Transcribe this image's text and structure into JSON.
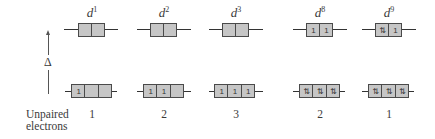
{
  "axis": {
    "symbol": "Δ",
    "direction": "up"
  },
  "configs": [
    {
      "label_base": "d",
      "label_sup": "1",
      "upper": [
        "",
        ""
      ],
      "lower": [
        "1",
        "",
        ""
      ],
      "unpaired": "1"
    },
    {
      "label_base": "d",
      "label_sup": "2",
      "upper": [
        "",
        ""
      ],
      "lower": [
        "1",
        "1",
        ""
      ],
      "unpaired": "2"
    },
    {
      "label_base": "d",
      "label_sup": "3",
      "upper": [
        "",
        ""
      ],
      "lower": [
        "1",
        "1",
        "1"
      ],
      "unpaired": "3"
    },
    {
      "label_base": "d",
      "label_sup": "8",
      "upper": [
        "1",
        "1"
      ],
      "lower": [
        "⇅",
        "⇅",
        "⇅"
      ],
      "unpaired": "2"
    },
    {
      "label_base": "d",
      "label_sup": "9",
      "upper": [
        "⇅",
        "1"
      ],
      "lower": [
        "⇅",
        "⇅",
        "⇅"
      ],
      "unpaired": "1"
    }
  ],
  "row_label": {
    "line1": "Unpaired",
    "line2": "electrons"
  },
  "colors": {
    "box_fill": "#c6c6c6",
    "box_border": "#4a4a4a",
    "text": "#3a3a3a"
  }
}
